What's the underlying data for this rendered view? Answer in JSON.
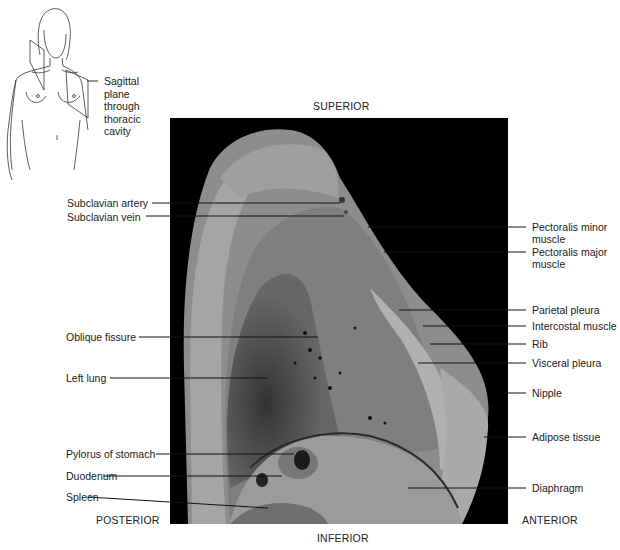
{
  "orientation": {
    "superior": "SUPERIOR",
    "inferior": "INFERIOR",
    "posterior": "POSTERIOR",
    "anterior": "ANTERIOR"
  },
  "inset": {
    "label": "Sagittal plane through thoracic cavity",
    "lines": [
      "Sagittal",
      "plane",
      "through",
      "thoracic",
      "cavity"
    ]
  },
  "labels_left": [
    {
      "text": "Subclavian artery"
    },
    {
      "text": "Subclavian vein"
    },
    {
      "text": "Oblique fissure"
    },
    {
      "text": "Left lung"
    },
    {
      "text": "Pylorus of stomach"
    },
    {
      "text": "Duodenum"
    },
    {
      "text": "Spleen"
    }
  ],
  "labels_right": [
    {
      "text": "Pectoralis minor muscle",
      "l1": "Pectoralis minor",
      "l2": "muscle"
    },
    {
      "text": "Pectoralis major muscle",
      "l1": "Pectoralis major",
      "l2": "muscle"
    },
    {
      "text": "Parietal pleura"
    },
    {
      "text": "Intercostal muscle"
    },
    {
      "text": "Rib"
    },
    {
      "text": "Visceral pleura"
    },
    {
      "text": "Nipple"
    },
    {
      "text": "Adipose tissue"
    },
    {
      "text": "Diaphragm"
    }
  ]
}
